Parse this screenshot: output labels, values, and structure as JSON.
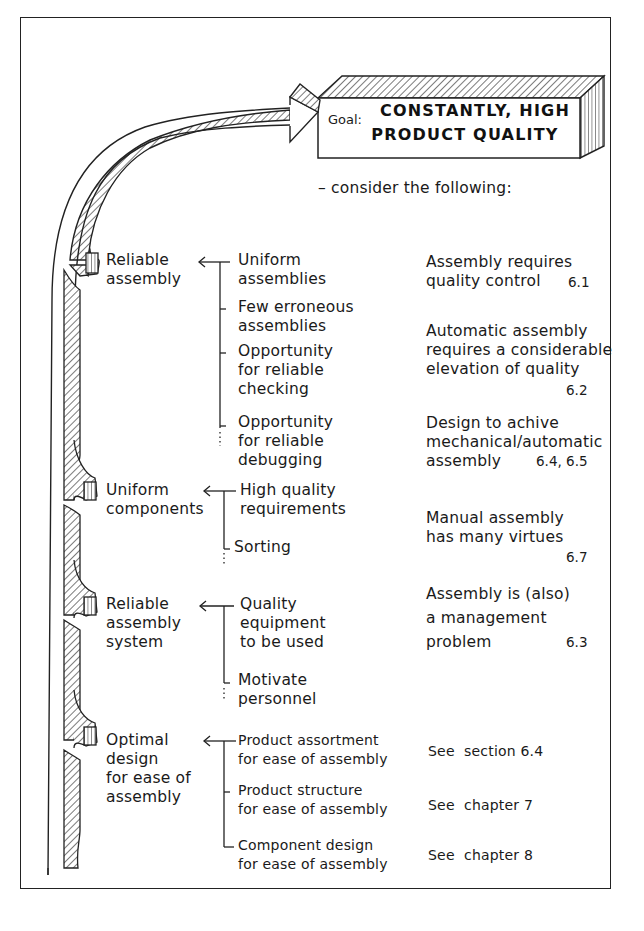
{
  "goal": {
    "label": "Goal:",
    "title_line1": "CONSTANTLY, HIGH",
    "title_line2": "PRODUCT QUALITY"
  },
  "intro": "– consider the following:",
  "factors": [
    {
      "name_lines": [
        "Reliable",
        "assembly"
      ],
      "subfactors": [
        {
          "lines": [
            "Uniform",
            "assemblies"
          ]
        },
        {
          "lines": [
            "Few erroneous",
            "assemblies"
          ]
        },
        {
          "lines": [
            "Opportunity",
            "for reliable",
            "checking"
          ]
        },
        {
          "lines": [
            "Opportunity",
            "for reliable",
            "debugging"
          ]
        }
      ]
    },
    {
      "name_lines": [
        "Uniform",
        "components"
      ],
      "subfactors": [
        {
          "lines": [
            "High quality",
            "requirements"
          ]
        },
        {
          "lines": [
            "Sorting"
          ]
        }
      ]
    },
    {
      "name_lines": [
        "Reliable",
        "assembly",
        "system"
      ],
      "subfactors": [
        {
          "lines": [
            "Quality",
            "equipment",
            "to be used"
          ]
        },
        {
          "lines": [
            "Motivate",
            "personnel"
          ]
        }
      ]
    },
    {
      "name_lines": [
        "Optimal",
        "design",
        "for ease of",
        "assembly"
      ],
      "subfactors": [
        {
          "lines": [
            "Product assortment",
            "for ease of assembly"
          ]
        },
        {
          "lines": [
            "Product structure",
            "for ease of assembly"
          ]
        },
        {
          "lines": [
            "Component design",
            "for ease of assembly"
          ]
        }
      ]
    }
  ],
  "notes": [
    {
      "lines": [
        "Assembly requires",
        "quality control"
      ],
      "ref": "6.1"
    },
    {
      "lines": [
        "Automatic assembly",
        "requires a considerable",
        "elevation of quality"
      ],
      "ref": "6.2"
    },
    {
      "lines": [
        "Design to achive",
        "mechanical/automatic",
        "assembly"
      ],
      "ref": "6.4, 6.5"
    },
    {
      "lines": [
        "Manual assembly",
        "has many virtues"
      ],
      "ref": "6.7"
    },
    {
      "lines": [
        "Assembly is (also)",
        "a management",
        "problem"
      ],
      "ref": "6.3"
    },
    {
      "lines": [
        "See  section 6.4"
      ],
      "ref": ""
    },
    {
      "lines": [
        "See  chapter 7"
      ],
      "ref": ""
    },
    {
      "lines": [
        "See  chapter 8"
      ],
      "ref": ""
    }
  ]
}
